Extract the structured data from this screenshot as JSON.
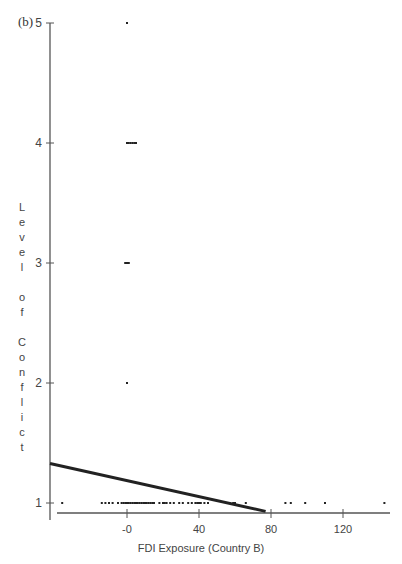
{
  "chart_data": {
    "type": "scatter",
    "panel_label": "(b)",
    "title": "",
    "xlabel": "FDI Exposure (Country B)",
    "ylabel": "Level of Conflict",
    "xlim": [
      -38,
      146
    ],
    "ylim": [
      1,
      5
    ],
    "x_ticks": [
      {
        "value": 0,
        "label": "-0"
      },
      {
        "value": 40,
        "label": "40"
      },
      {
        "value": 80,
        "label": "80"
      },
      {
        "value": 120,
        "label": "120"
      }
    ],
    "y_ticks": [
      {
        "value": 1,
        "label": "1"
      },
      {
        "value": 2,
        "label": "2"
      },
      {
        "value": 3,
        "label": "3"
      },
      {
        "value": 4,
        "label": "4"
      },
      {
        "value": 5,
        "label": "5"
      }
    ],
    "grid": false,
    "legend": null,
    "series": [
      {
        "name": "observations",
        "type": "scatter",
        "points": [
          [
            0,
            5
          ],
          [
            0,
            4
          ],
          [
            1,
            4
          ],
          [
            2,
            4
          ],
          [
            3,
            4
          ],
          [
            4,
            4
          ],
          [
            5,
            4
          ],
          [
            -1,
            3
          ],
          [
            0,
            3
          ],
          [
            1,
            3
          ],
          [
            0,
            2
          ],
          [
            -36,
            1
          ],
          [
            -14,
            1
          ],
          [
            -12,
            1
          ],
          [
            -10,
            1
          ],
          [
            -8,
            1
          ],
          [
            -5,
            1
          ],
          [
            -3,
            1
          ],
          [
            -2,
            1
          ],
          [
            -1,
            1
          ],
          [
            0,
            1
          ],
          [
            1,
            1
          ],
          [
            2,
            1
          ],
          [
            3,
            1
          ],
          [
            4,
            1
          ],
          [
            5,
            1
          ],
          [
            6,
            1
          ],
          [
            7,
            1
          ],
          [
            8,
            1
          ],
          [
            9,
            1
          ],
          [
            10,
            1
          ],
          [
            11,
            1
          ],
          [
            12,
            1
          ],
          [
            13,
            1
          ],
          [
            14,
            1
          ],
          [
            15,
            1
          ],
          [
            18,
            1
          ],
          [
            20,
            1
          ],
          [
            21,
            1
          ],
          [
            22,
            1
          ],
          [
            24,
            1
          ],
          [
            26,
            1
          ],
          [
            29,
            1
          ],
          [
            31,
            1
          ],
          [
            34,
            1
          ],
          [
            36,
            1
          ],
          [
            38,
            1
          ],
          [
            39,
            1
          ],
          [
            40,
            1
          ],
          [
            41,
            1
          ],
          [
            43,
            1
          ],
          [
            45,
            1
          ],
          [
            57,
            1
          ],
          [
            59,
            1
          ],
          [
            60,
            1
          ],
          [
            66,
            1
          ],
          [
            88,
            1
          ],
          [
            91,
            1
          ],
          [
            99,
            1
          ],
          [
            110,
            1
          ],
          [
            143,
            1
          ]
        ]
      },
      {
        "name": "fitted line",
        "type": "line",
        "points": [
          [
            -43,
            1.33
          ],
          [
            77,
            0.93
          ]
        ]
      }
    ]
  }
}
